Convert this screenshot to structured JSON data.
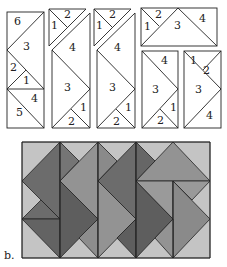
{
  "caption": "b.",
  "colors": {
    "outline": "#222222",
    "paper": "#ffffff",
    "light": "#c4c4c4",
    "medium": "#939393",
    "dark": "#6c6c6c",
    "darker": "#5e5e5e"
  },
  "top_figure": {
    "pieces": [
      {
        "id": "A",
        "labels": [
          "6",
          "3",
          "2",
          "1",
          "4",
          "5"
        ]
      },
      {
        "id": "B",
        "labels": [
          "1",
          "2",
          "4",
          "3",
          "1",
          "2"
        ]
      },
      {
        "id": "C",
        "labels": [
          "1",
          "2",
          "4",
          "3",
          "1",
          "2"
        ]
      },
      {
        "id": "D",
        "labels": [
          "1",
          "2",
          "3",
          "4"
        ]
      },
      {
        "id": "E",
        "labels": [
          "4",
          "3",
          "1",
          "2"
        ]
      },
      {
        "id": "F",
        "labels": [
          "1",
          "2",
          "3",
          "4"
        ]
      }
    ]
  },
  "bottom_figure": {
    "columns": 5,
    "rows": 3,
    "description": "Tessellation of gray triangles forming zigzag strips"
  }
}
